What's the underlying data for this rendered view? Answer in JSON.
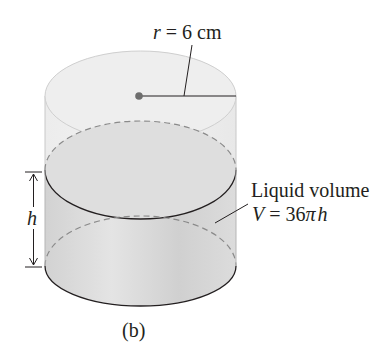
{
  "figure": {
    "caption": "(b)",
    "radius_label": {
      "var": "r",
      "eq": "=",
      "value": "6 cm"
    },
    "height_label": "h",
    "volume_label": {
      "line1": "Liquid volume",
      "var": "V",
      "eq": "=",
      "expr_num": "36",
      "expr_pi": "π",
      "expr_h": "h"
    },
    "colors": {
      "outline": "#231f20",
      "container_fill": "#e9e9e9",
      "liquid_fill": "#d6d6d6",
      "dash": "#8a8a8a",
      "center_dot": "#6d6d6d"
    }
  }
}
